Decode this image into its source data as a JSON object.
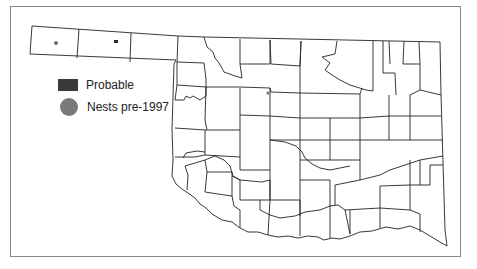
{
  "map": {
    "region": "Oklahoma",
    "subdivision": "counties",
    "colors": {
      "border": "#8a8a8a",
      "county_lines": "#222222",
      "probable": "#3a3a3a",
      "nests_pre_1997": "#7a7a7a"
    }
  },
  "legend": {
    "items": [
      {
        "label": "Probable",
        "symbol": "rectangle",
        "color": "#3a3a3a"
      },
      {
        "label": "Nests pre-1997",
        "symbol": "circle",
        "color": "#7a7a7a"
      }
    ]
  },
  "markers": [
    {
      "type": "nests_pre_1997",
      "location": "western panhandle (Cimarron County)",
      "x": 56,
      "y": 43
    },
    {
      "type": "probable",
      "location": "central panhandle (Texas County)",
      "x": 116,
      "y": 41
    },
    {
      "type": "nests_pre_1997",
      "location": "north-central Oklahoma",
      "x": 268,
      "y": 93
    }
  ]
}
